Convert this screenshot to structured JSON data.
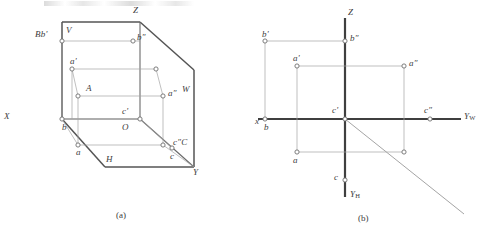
{
  "figure": {
    "title_strip": "",
    "colors": {
      "heavy_line": "#4a4a4a",
      "light_line": "#9a9a9a",
      "marker_stroke": "#7d7d7d",
      "text": "#3c3c3c",
      "background": "#ffffff"
    }
  },
  "panel_a": {
    "caption": "(a)",
    "plane_labels": {
      "v_plane": "V",
      "h_plane": "H",
      "w_plane": "W"
    },
    "axis_labels": {
      "z": "Z",
      "x": "X",
      "y": "Y",
      "origin": "O"
    },
    "point_labels": {
      "bb_prime": "Bb'",
      "b_double_prime": "b″",
      "a_prime": "a'",
      "a_point": "A",
      "a_double_prime": "a″",
      "b_bottom": "b",
      "a_bottom": "a",
      "c_prime": "c'",
      "c_double_prime_c": "c″C",
      "c_bottom": "c"
    }
  },
  "panel_b": {
    "caption": "(b)",
    "axis_labels": {
      "z": "Z",
      "x": "x",
      "y_w": "Y",
      "y_w_sub": "W",
      "y_h": "Y",
      "y_h_sub": "H"
    },
    "point_labels": {
      "b_prime": "b'",
      "b_double_prime": "b″",
      "a_prime": "a'",
      "a_double_prime": "a″",
      "c_prime": "c'",
      "c_double_prime": "c″",
      "b_bottom": "b",
      "a_bottom": "a",
      "c_bottom": "c"
    }
  },
  "geometry_a": {
    "frame_outline": "62,22 139,22 193,70 193,166 104,166 62,119",
    "v_plane_corner": "62,22 62,119",
    "notes": "three mutually perpendicular projection planes drawn in axonometric view"
  },
  "geometry_b": {
    "z_axis": "vertical axis through origin",
    "yw_axis": "horizontal axis to the right",
    "yh_axis": "vertical axis downward",
    "bisector": "45 degree ray from origin to lower right"
  }
}
